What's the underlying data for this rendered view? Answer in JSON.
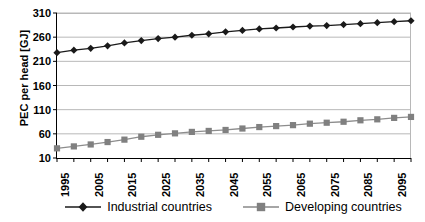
{
  "chart_data": {
    "type": "line",
    "title": "",
    "xlabel": "",
    "ylabel": "PEC per head [GJ]",
    "ylim": [
      10,
      310
    ],
    "y_ticks": [
      10,
      60,
      110,
      160,
      210,
      260,
      310
    ],
    "xlim": [
      1995,
      2100
    ],
    "x_ticks": [
      1995,
      2000,
      2005,
      2010,
      2015,
      2020,
      2025,
      2030,
      2035,
      2040,
      2045,
      2050,
      2055,
      2060,
      2065,
      2070,
      2075,
      2080,
      2085,
      2090,
      2095,
      2100
    ],
    "x_tick_labels": [
      "1995",
      "",
      "2005",
      "",
      "2015",
      "",
      "2025",
      "",
      "2035",
      "",
      "2045",
      "",
      "2055",
      "",
      "2065",
      "",
      "2075",
      "",
      "2085",
      "",
      "2095",
      ""
    ],
    "grid": "horizontal",
    "legend_position": "bottom",
    "x": [
      1995,
      2000,
      2005,
      2010,
      2015,
      2020,
      2025,
      2030,
      2035,
      2040,
      2045,
      2050,
      2055,
      2060,
      2065,
      2070,
      2075,
      2080,
      2085,
      2090,
      2095,
      2100
    ],
    "series": [
      {
        "name": "Industrial countries",
        "marker": "diamond",
        "color": "#1a1a1a",
        "values": [
          228,
          233,
          237,
          242,
          248,
          253,
          257,
          260,
          264,
          267,
          271,
          274,
          277,
          279,
          281,
          283,
          284,
          286,
          288,
          290,
          292,
          294
        ]
      },
      {
        "name": "Developing countries",
        "marker": "square",
        "color": "#808080",
        "values": [
          30,
          34,
          38,
          43,
          48,
          54,
          58,
          61,
          64,
          66,
          68,
          71,
          74,
          76,
          78,
          81,
          83,
          85,
          88,
          90,
          93,
          95
        ]
      }
    ]
  },
  "legend": {
    "entries": [
      {
        "label": "Industrial countries",
        "color": "#1a1a1a",
        "marker": "diamond"
      },
      {
        "label": "Developing countries",
        "color": "#808080",
        "marker": "square"
      }
    ]
  }
}
